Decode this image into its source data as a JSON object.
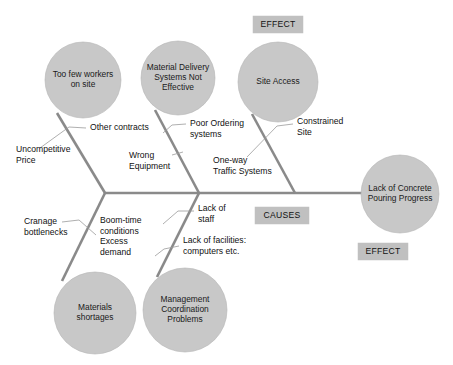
{
  "diagram": {
    "head": {
      "line1": "Lack of  Concrete",
      "line2": "Pouring Progress",
      "cx": 400,
      "cy": 194,
      "r": 39
    },
    "tags": [
      {
        "id": "effect-top",
        "label": "EFFECT",
        "x": 253,
        "y": 16,
        "w": 50,
        "h": 17
      },
      {
        "id": "causes",
        "label": "CAUSES",
        "x": 255,
        "y": 207,
        "w": 54,
        "h": 17
      },
      {
        "id": "effect-bottom",
        "label": "EFFECT",
        "x": 358,
        "y": 243,
        "w": 50,
        "h": 17
      }
    ],
    "bubbles": [
      {
        "id": "too-few-workers",
        "lines": [
          "Too few workers",
          "on site"
        ],
        "cx": 83,
        "cy": 80,
        "r": 38
      },
      {
        "id": "material-delivery",
        "lines": [
          "Material Delivery",
          "Systems Not",
          "Effective"
        ],
        "cx": 178,
        "cy": 78,
        "r": 37
      },
      {
        "id": "site-access",
        "lines": [
          "Site Access"
        ],
        "cx": 278,
        "cy": 82,
        "r": 40
      },
      {
        "id": "materials-shortages",
        "lines": [
          "Materials",
          "shortages"
        ],
        "cx": 95,
        "cy": 313,
        "r": 41
      },
      {
        "id": "management-coordination",
        "lines": [
          "Management",
          "Coordination",
          "Problems"
        ],
        "cx": 185,
        "cy": 310,
        "r": 42
      }
    ],
    "causes": [
      {
        "id": "other-contracts",
        "lines": [
          "Other  contracts"
        ],
        "x": 90,
        "y": 130
      },
      {
        "id": "uncompetitive-price",
        "lines": [
          "Uncompetitive",
          "Price"
        ],
        "x": 16,
        "y": 152
      },
      {
        "id": "poor-ordering",
        "lines": [
          "Poor Ordering",
          "systems"
        ],
        "x": 190,
        "y": 126
      },
      {
        "id": "wrong-equipment",
        "lines": [
          "Wrong",
          "Equipment"
        ],
        "x": 129,
        "y": 158
      },
      {
        "id": "constrained-site",
        "lines": [
          "Constrained",
          "Site"
        ],
        "x": 297,
        "y": 124
      },
      {
        "id": "one-way-traffic",
        "lines": [
          "One-way",
          "Traffic Systems"
        ],
        "x": 213,
        "y": 163
      },
      {
        "id": "cranage-bottlenecks",
        "lines": [
          "Cranage",
          "bottlenecks"
        ],
        "x": 24,
        "y": 224
      },
      {
        "id": "boom-time",
        "lines": [
          "Boom-time",
          "conditions",
          "Excess",
          "demand"
        ],
        "x": 100,
        "y": 223
      },
      {
        "id": "lack-of-staff",
        "lines": [
          "Lack of",
          "staff"
        ],
        "x": 198,
        "y": 211
      },
      {
        "id": "lack-of-facilities",
        "lines": [
          "Lack of facilities:",
          "computers etc."
        ],
        "x": 183,
        "y": 243
      }
    ],
    "spine": {
      "x1": 105,
      "y1": 193,
      "x2": 372,
      "y2": 193
    },
    "ribs": [
      {
        "id": "rib-workers",
        "x1": 105,
        "y1": 193,
        "x2": 57,
        "y2": 113
      },
      {
        "id": "rib-delivery",
        "x1": 199,
        "y1": 193,
        "x2": 155,
        "y2": 110
      },
      {
        "id": "rib-access",
        "x1": 295,
        "y1": 193,
        "x2": 252,
        "y2": 114
      },
      {
        "id": "rib-materials",
        "x1": 105,
        "y1": 193,
        "x2": 62,
        "y2": 281
      },
      {
        "id": "rib-management",
        "x1": 199,
        "y1": 193,
        "x2": 157,
        "y2": 277
      }
    ],
    "leaders": [
      {
        "id": "leader-other-contracts",
        "path": "M 86 128 L 69 127 L 40 148"
      },
      {
        "id": "leader-poor-ordering",
        "path": "M 186 124 L 172 125 L 163 133"
      },
      {
        "id": "leader-constrained-site",
        "path": "M 293 124 L 277 126 L 247 157"
      },
      {
        "id": "leader-wrong-equipment",
        "path": "M 172 155 L 183 152"
      },
      {
        "id": "leader-cranage",
        "path": "M 62 222 L 79 220 L 96 235"
      },
      {
        "id": "leader-lack-staff",
        "path": "M 194 211 L 178 211 L 163 224"
      },
      {
        "id": "leader-lack-facilities",
        "path": "M 179 246 L 164 249 L 155 256"
      }
    ]
  }
}
